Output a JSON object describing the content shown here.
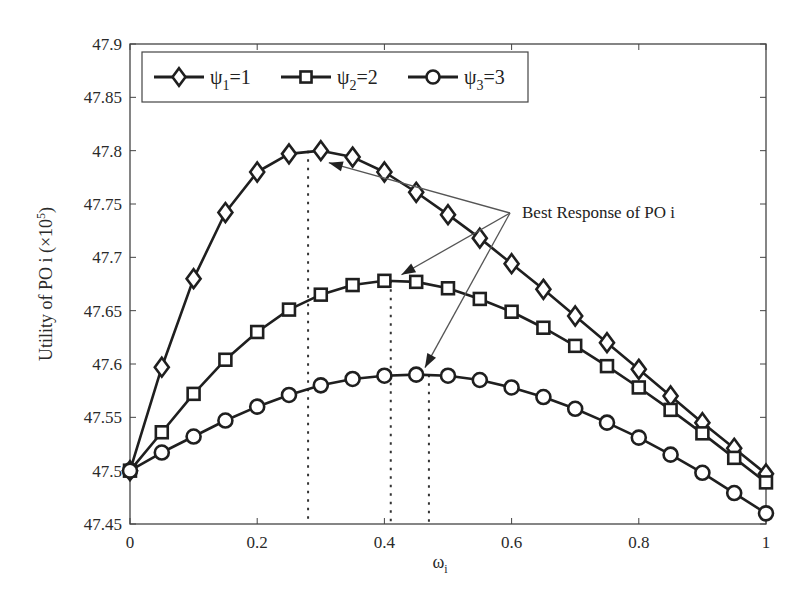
{
  "chart_data": {
    "type": "line",
    "title": "",
    "xlabel": "ω_i",
    "xlabel_main": "ω",
    "xlabel_sub": "i",
    "ylabel": "Utility of PO i (×10^5)",
    "ylabel_main": "Utility of PO i (×10",
    "ylabel_sup": "5",
    "ylabel_close": ")",
    "xlim": [
      0,
      1
    ],
    "ylim": [
      47.45,
      47.9
    ],
    "xticks": [
      0,
      0.2,
      0.4,
      0.6,
      0.8,
      1
    ],
    "xtick_labels": [
      "0",
      "0.2",
      "0.4",
      "0.6",
      "0.8",
      "1"
    ],
    "yticks": [
      47.45,
      47.5,
      47.55,
      47.6,
      47.65,
      47.7,
      47.75,
      47.8,
      47.85,
      47.9
    ],
    "ytick_labels": [
      "47.45",
      "47.5",
      "47.55",
      "47.6",
      "47.65",
      "47.7",
      "47.75",
      "47.8",
      "47.85",
      "47.9"
    ],
    "grid": false,
    "legend_position": "top-left, horizontal",
    "x": [
      0,
      0.05,
      0.1,
      0.15,
      0.2,
      0.25,
      0.3,
      0.35,
      0.4,
      0.45,
      0.5,
      0.55,
      0.6,
      0.65,
      0.7,
      0.75,
      0.8,
      0.85,
      0.9,
      0.95,
      1.0
    ],
    "series": [
      {
        "name": "ψ1=1",
        "psi": "ψ",
        "sub": "1",
        "eq": "=1",
        "marker": "diamond",
        "values": [
          47.5,
          47.597,
          47.68,
          47.742,
          47.78,
          47.797,
          47.8,
          47.794,
          47.78,
          47.761,
          47.74,
          47.718,
          47.694,
          47.67,
          47.645,
          47.62,
          47.595,
          47.57,
          47.545,
          47.521,
          47.497
        ]
      },
      {
        "name": "ψ2=2",
        "psi": "ψ",
        "sub": "2",
        "eq": "=2",
        "marker": "square",
        "values": [
          47.5,
          47.536,
          47.572,
          47.604,
          47.63,
          47.651,
          47.665,
          47.674,
          47.678,
          47.677,
          47.671,
          47.661,
          47.649,
          47.634,
          47.617,
          47.598,
          47.578,
          47.557,
          47.535,
          47.512,
          47.489
        ]
      },
      {
        "name": "ψ3=3",
        "psi": "ψ",
        "sub": "3",
        "eq": "=3",
        "marker": "circle",
        "values": [
          47.5,
          47.517,
          47.532,
          47.547,
          47.56,
          47.571,
          47.58,
          47.586,
          47.589,
          47.59,
          47.589,
          47.585,
          47.578,
          47.569,
          47.558,
          47.545,
          47.531,
          47.515,
          47.498,
          47.479,
          47.46
        ]
      }
    ],
    "best_response_markers": [
      {
        "series": "ψ1=1",
        "x": 0.28,
        "y": 47.8
      },
      {
        "series": "ψ2=2",
        "x": 0.41,
        "y": 47.678
      },
      {
        "series": "ψ3=3",
        "x": 0.47,
        "y": 47.59
      }
    ],
    "annotations": [
      {
        "text": "Best Response of PO i",
        "x": 0.615,
        "y": 47.76
      }
    ]
  },
  "colors": {
    "line": "#1f1f1f",
    "axis": "#444444",
    "arrow": "#555555",
    "background": "#ffffff"
  }
}
